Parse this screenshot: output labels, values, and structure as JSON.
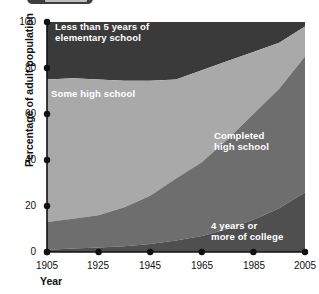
{
  "artifact": {
    "name": "clipped-badge-top-edge"
  },
  "chart_data": {
    "type": "area",
    "stacked": true,
    "title": "",
    "xlabel": "Year",
    "ylabel": "Percentage of adult population",
    "xlim": [
      1905,
      2005
    ],
    "ylim": [
      0,
      100
    ],
    "xticks": [
      1905,
      1925,
      1945,
      1965,
      1985,
      2005
    ],
    "yticks": [
      0,
      20,
      40,
      60,
      80,
      100
    ],
    "xtick_labels": [
      "1905",
      "1925",
      "1945",
      "1965",
      "1985",
      "2005"
    ],
    "ytick_labels": [
      "0",
      "20",
      "40",
      "60",
      "80",
      "100"
    ],
    "grid": false,
    "legend": "in-plot labels",
    "x": [
      1905,
      1915,
      1925,
      1935,
      1945,
      1955,
      1965,
      1975,
      1985,
      1995,
      2005
    ],
    "series": [
      {
        "name": "4 years or more of college",
        "label": "4 years or\nmore of college",
        "color": "#4f4f4f",
        "values": [
          1,
          1.5,
          2,
          2.5,
          3.5,
          5,
          7,
          10,
          14,
          19,
          26
        ]
      },
      {
        "name": "Completed high school",
        "label": "Completed\nhigh school",
        "color": "#6e6e6e",
        "values": [
          12,
          13,
          14,
          17,
          21,
          27,
          32,
          39,
          46,
          52,
          59
        ]
      },
      {
        "name": "Some high school",
        "label": "Some high school",
        "color": "#a9a9a9",
        "values": [
          62,
          61,
          59,
          55,
          50,
          43,
          40,
          34,
          27,
          20,
          13
        ]
      },
      {
        "name": "Less than 5 years of elementary school",
        "label": "Less than 5 years of\nelementary school",
        "color": "#3a3a3a",
        "values": [
          25,
          24.5,
          25,
          25.5,
          25.5,
          25,
          21,
          17,
          13,
          9,
          2
        ]
      }
    ],
    "cumulative_tops": {
      "college": [
        1,
        1.5,
        2,
        2.5,
        3.5,
        5,
        7,
        10,
        14,
        19,
        26
      ],
      "completed_high_school": [
        13,
        14.5,
        16,
        19.5,
        24.5,
        32,
        39,
        49,
        60,
        71,
        85
      ],
      "some_high_school": [
        75,
        75.5,
        75,
        74.5,
        74.5,
        75,
        79,
        83,
        87,
        91,
        98
      ],
      "less_than_5_years": [
        100,
        100,
        100,
        100,
        100,
        100,
        100,
        100,
        100,
        100,
        100
      ]
    }
  },
  "colors": {
    "background": "#ffffff",
    "axis": "#111111",
    "band_elementary": "#3a3a3a",
    "band_some_high_school": "#a9a9a9",
    "band_completed_high_school": "#6e6e6e",
    "band_college": "#4f4f4f",
    "label_text": "#ffffff"
  }
}
